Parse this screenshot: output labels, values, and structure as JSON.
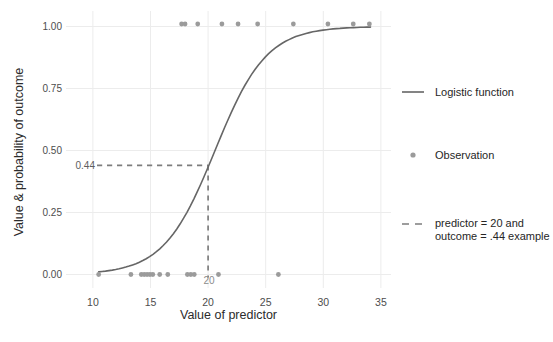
{
  "chart_data": {
    "type": "line+scatter",
    "title": "",
    "xlabel": "Value of predictor",
    "ylabel": "Value & probability of outcome",
    "x_ticks": [
      10,
      15,
      20,
      25,
      30,
      35
    ],
    "y_ticks": [
      {
        "value": 0,
        "label": "0.00"
      },
      {
        "value": 0.25,
        "label": "0.25"
      },
      {
        "value": 0.5,
        "label": "0.50"
      },
      {
        "value": 0.75,
        "label": "0.75"
      },
      {
        "value": 1,
        "label": "1.00"
      }
    ],
    "xlim": [
      7.7,
      35.9
    ],
    "ylim": [
      -0.05,
      1.06
    ],
    "grid": {
      "show_major": true,
      "color": "#ececec"
    },
    "logistic_curve": {
      "model": "y = 1 / (1 + exp(-k*(x - x0)))",
      "k": 0.45,
      "x0": 20.6,
      "x_start": 10.5,
      "x_end": 34.1,
      "color": "#666666"
    },
    "observations": {
      "color": "#9b9b9b",
      "y1_x": [
        17.7,
        18.0,
        19.1,
        21.2,
        22.6,
        24.3,
        27.4,
        30.4,
        32.6,
        34.0
      ],
      "y0_x": [
        10.5,
        13.3,
        14.2,
        14.45,
        14.7,
        14.95,
        15.2,
        15.8,
        16.5,
        18.2,
        18.5,
        18.8,
        20.9,
        26.1
      ]
    },
    "example_annotation": {
      "predictor": 20,
      "outcome": 0.44,
      "x_label": "20",
      "y_label": "0.44",
      "dash_color": "#7d7d7d",
      "label_color": "#8c8c8c",
      "y_label_color": "#5e5e5e"
    },
    "tick_label_color": "#4d4d4d",
    "legend": [
      {
        "type": "line",
        "lines": [
          "Logistic function"
        ]
      },
      {
        "type": "point",
        "lines": [
          "Observation"
        ]
      },
      {
        "type": "dash",
        "lines": [
          "predictor = 20 and",
          "outcome = .44 example"
        ]
      }
    ]
  }
}
